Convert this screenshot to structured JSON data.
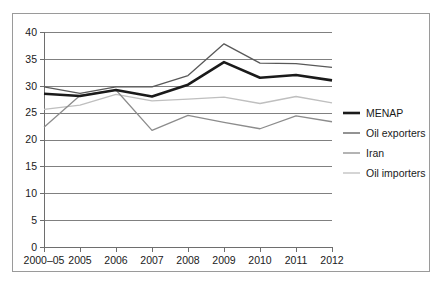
{
  "chart_data": {
    "type": "line",
    "title": "",
    "subtitle": "",
    "xlabel": "",
    "ylabel": "",
    "categories": [
      "2000–05",
      "2005",
      "2006",
      "2007",
      "2008",
      "2009",
      "2010",
      "2011",
      "2012"
    ],
    "ylim": [
      0,
      40
    ],
    "yticks": [
      0,
      5,
      10,
      15,
      20,
      25,
      30,
      35,
      40
    ],
    "ytick_labels": [
      "0",
      "5",
      "10",
      "15",
      "20",
      "25",
      "30",
      "35",
      "40"
    ],
    "grid": true,
    "grid_axis": "y",
    "legend_position": "right",
    "series": [
      {
        "name": "MENAP",
        "color": "#1a1a1a",
        "width": 2.6,
        "values": [
          28.5,
          28.1,
          29.2,
          28.0,
          30.2,
          34.4,
          31.5,
          32.0,
          31.0
        ]
      },
      {
        "name": "Oil exporters",
        "color": "#595959",
        "width": 1.3,
        "values": [
          29.8,
          28.6,
          29.8,
          29.8,
          31.9,
          37.8,
          34.2,
          34.1,
          33.4
        ]
      },
      {
        "name": "Iran",
        "color": "#8c8c8c",
        "width": 1.3,
        "values": [
          22.3,
          28.2,
          29.2,
          21.7,
          24.5,
          23.2,
          22.0,
          24.4,
          23.3
        ]
      },
      {
        "name": "Oil importers",
        "color": "#bfbfbf",
        "width": 1.3,
        "values": [
          25.6,
          26.4,
          28.4,
          27.2,
          27.5,
          27.9,
          26.7,
          28.0,
          26.8
        ]
      }
    ]
  },
  "colors": {
    "gridline": "#808080",
    "axis": "#6e6e6e",
    "frame": "#9a9a9a",
    "background": "#ffffff",
    "text": "#1a1a1a"
  }
}
